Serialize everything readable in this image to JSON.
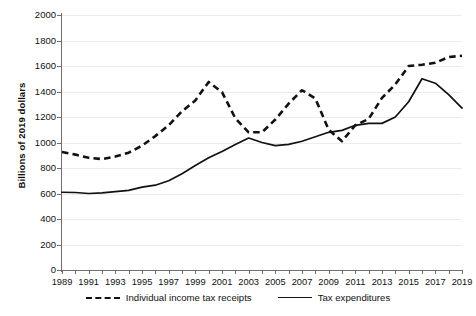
{
  "chart_data": {
    "type": "line",
    "title": "",
    "xlabel": "",
    "ylabel": "Billions of 2019 dollars",
    "xlim": [
      1989,
      2019
    ],
    "ylim": [
      0,
      2000
    ],
    "ytick_step": 200,
    "xtick_step": 1,
    "xlabel_step": 2,
    "grid": true,
    "legend_position": "bottom",
    "yticks": [
      0,
      200,
      400,
      600,
      800,
      1000,
      1200,
      1400,
      1600,
      1800,
      2000
    ],
    "xticks": [
      1989,
      1990,
      1991,
      1992,
      1993,
      1994,
      1995,
      1996,
      1997,
      1998,
      1999,
      2000,
      2001,
      2002,
      2003,
      2004,
      2005,
      2006,
      2007,
      2008,
      2009,
      2010,
      2011,
      2012,
      2013,
      2014,
      2015,
      2016,
      2017,
      2018,
      2019
    ],
    "xtick_labels": [
      "1989",
      "1991",
      "1993",
      "1995",
      "1997",
      "1999",
      "2001",
      "2003",
      "2005",
      "2007",
      "2009",
      "2011",
      "2013",
      "2015",
      "2017",
      "2019"
    ],
    "x": [
      1989,
      1990,
      1991,
      1992,
      1993,
      1994,
      1995,
      1996,
      1997,
      1998,
      1999,
      2000,
      2001,
      2002,
      2003,
      2004,
      2005,
      2006,
      2007,
      2008,
      2009,
      2010,
      2011,
      2012,
      2013,
      2014,
      2015,
      2016,
      2017,
      2018,
      2019
    ],
    "series": [
      {
        "name": "Individual income tax receipts",
        "style": "dashed",
        "color": "#111111",
        "values": [
          925,
          905,
          880,
          870,
          890,
          920,
          975,
          1050,
          1135,
          1245,
          1330,
          1475,
          1395,
          1190,
          1080,
          1080,
          1180,
          1305,
          1410,
          1345,
          1100,
          1010,
          1135,
          1185,
          1350,
          1455,
          1600,
          1610,
          1625,
          1670,
          1680
        ]
      },
      {
        "name": "Tax expenditures",
        "style": "solid",
        "color": "#111111",
        "values": [
          610,
          608,
          600,
          605,
          615,
          625,
          650,
          665,
          700,
          755,
          820,
          880,
          930,
          985,
          1035,
          1000,
          975,
          985,
          1010,
          1045,
          1080,
          1095,
          1135,
          1150,
          1150,
          1200,
          1320,
          1500,
          1465,
          1375,
          1270
        ]
      }
    ]
  },
  "legend": {
    "items": [
      {
        "label": "Individual income tax receipts",
        "style": "dashed"
      },
      {
        "label": "Tax expenditures",
        "style": "solid"
      }
    ]
  }
}
